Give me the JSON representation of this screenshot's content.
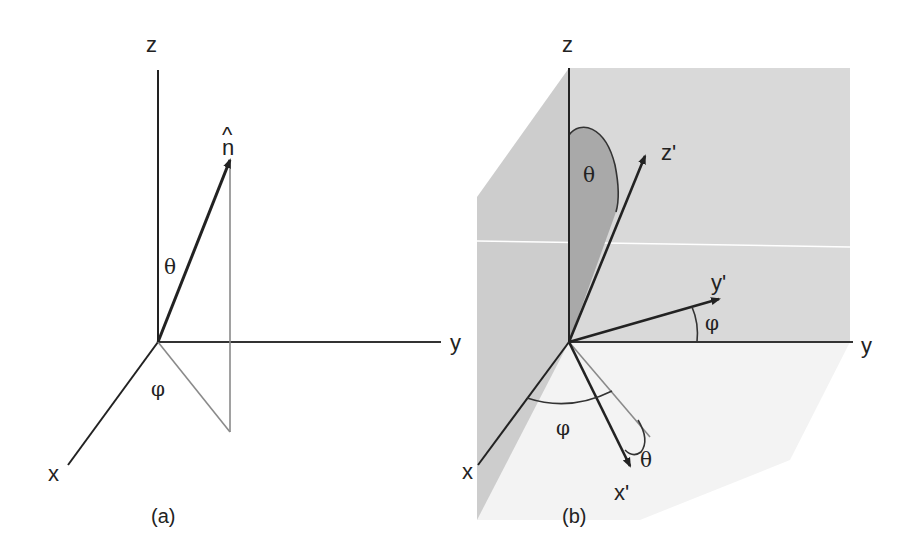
{
  "figure": {
    "panels": [
      {
        "caption": "(a)",
        "axes": {
          "z": "z",
          "y": "y",
          "x": "x"
        },
        "vector_label": "n̂",
        "vector_hat": "^",
        "vector_base": "n",
        "angles": {
          "polar": "θ",
          "azimuth": "φ"
        }
      },
      {
        "caption": "(b)",
        "axes": {
          "z": "z",
          "y": "y",
          "x": "x"
        },
        "rotated_axes": {
          "z_prime": "z'",
          "y_prime": "y'",
          "x_prime": "x'"
        },
        "angles": {
          "theta_z": "θ",
          "phi_y": "φ",
          "phi_x": "φ",
          "theta_x": "θ"
        }
      }
    ],
    "colors": {
      "line": "#222222",
      "projection": "#8a8a8a",
      "plane_back": "#d9d9d9",
      "plane_left": "#cfcfcf",
      "plane_floor": "#f2f2f2",
      "theta_fill": "#a9a9a9"
    }
  }
}
